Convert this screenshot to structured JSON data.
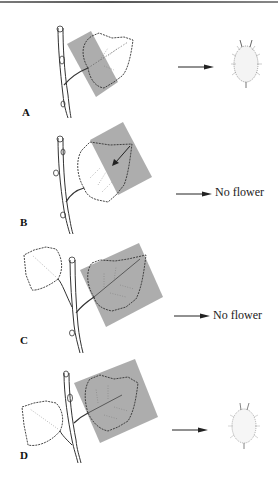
{
  "figure": {
    "panels": [
      {
        "id": "A",
        "label": "A",
        "result_type": "flower",
        "result_text": ""
      },
      {
        "id": "B",
        "label": "B",
        "result_type": "text",
        "result_text": "No flower"
      },
      {
        "id": "C",
        "label": "C",
        "result_type": "text",
        "result_text": "No flower"
      },
      {
        "id": "D",
        "label": "D",
        "result_type": "flower",
        "result_text": ""
      }
    ],
    "colors": {
      "shade": "#a9a9a9",
      "ink": "#222222",
      "background": "#ffffff"
    }
  }
}
